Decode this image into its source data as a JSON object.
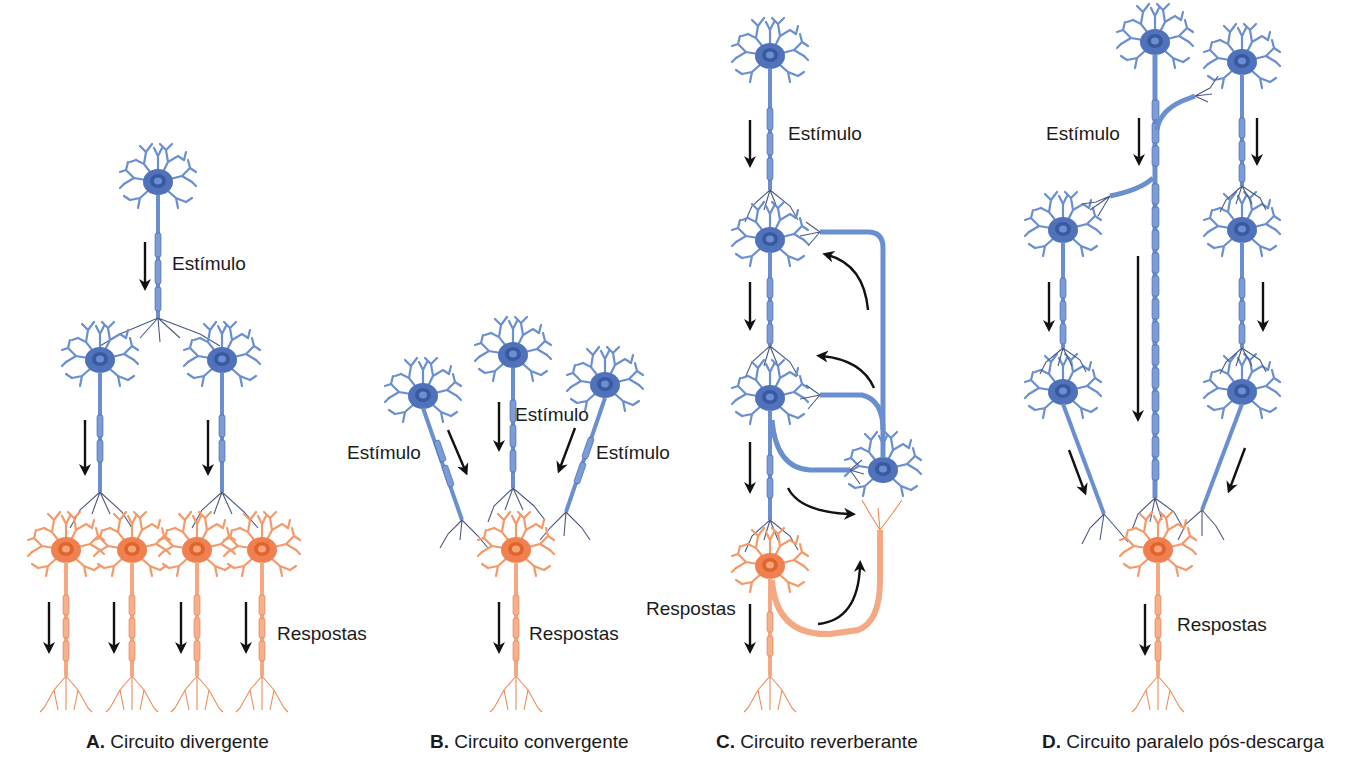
{
  "colors": {
    "presynaptic_neuron": "#5b7fc4",
    "presynaptic_dark": "#3e5fa8",
    "postsynaptic_neuron": "#f08a55",
    "postsynaptic_dark": "#e06a30",
    "terminal_lines": "#4a5a80",
    "arrow": "#111111",
    "background": "#ffffff"
  },
  "legend": {
    "blue": "presynaptic (input) neurons",
    "orange": "postsynaptic (output) neurons"
  },
  "panels": {
    "A": {
      "letter": "A.",
      "title": "Circuito divergente",
      "labels": {
        "stimulus": "Estímulo",
        "responses": "Respostas"
      },
      "input_neurons": 1,
      "intermediate_neurons": 2,
      "output_neurons": 4
    },
    "B": {
      "letter": "B.",
      "title": "Circuito convergente",
      "labels": {
        "stimulus_left": "Estímulo",
        "stimulus_center": "Estímulo",
        "stimulus_right": "Estímulo",
        "responses": "Respostas"
      },
      "input_neurons": 3,
      "output_neurons": 1
    },
    "C": {
      "letter": "C.",
      "title": "Circuito reverberante",
      "labels": {
        "stimulus": "Estímulo",
        "responses": "Respostas"
      },
      "chain_neurons": 3,
      "feedback_neurons": 1,
      "output_neurons": 1
    },
    "D": {
      "letter": "D.",
      "title": "Circuito paralelo pós-descarga",
      "labels": {
        "stimulus": "Estímulo",
        "responses": "Respostas"
      },
      "input_neurons": 1,
      "parallel_branch_neurons": 4,
      "output_neurons": 1
    }
  }
}
